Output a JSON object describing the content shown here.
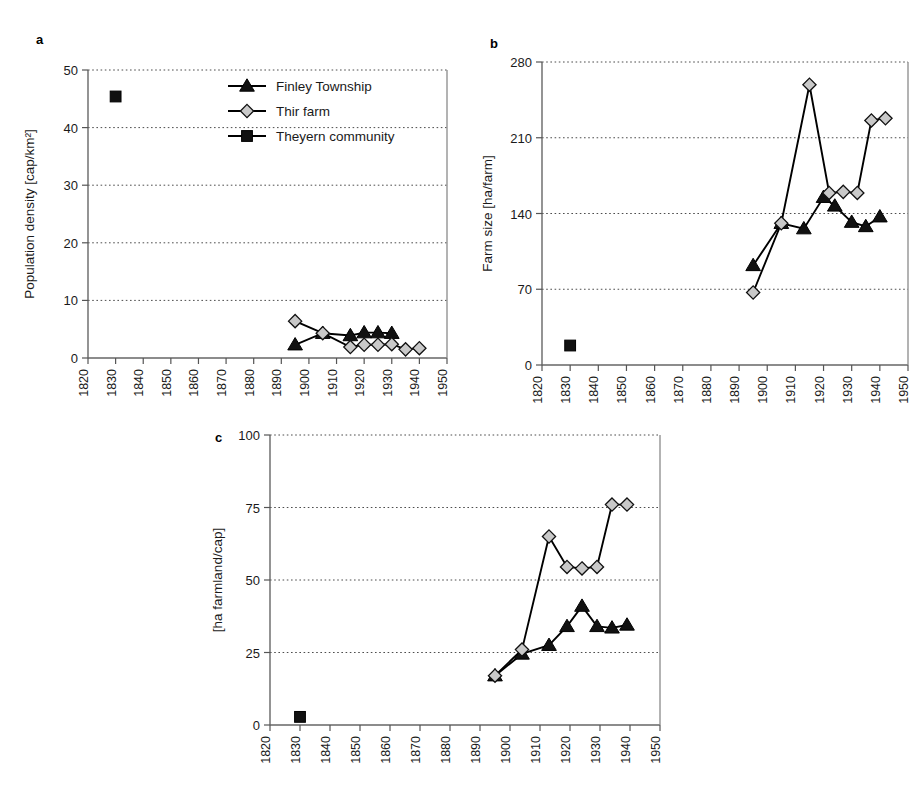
{
  "figure": {
    "background": "#ffffff",
    "panel_letters": [
      "a",
      "b",
      "c"
    ],
    "legend": {
      "position": "panel-a-top-right",
      "entries": [
        {
          "label": "Finley Township",
          "marker": "triangle",
          "color": "#111111"
        },
        {
          "label": "Thir farm",
          "marker": "diamond",
          "color": "#c9c9c9"
        },
        {
          "label": "Theyern community",
          "marker": "square",
          "color": "#111111"
        }
      ]
    }
  },
  "chart_data": [
    {
      "type": "line",
      "panel": "a",
      "title": "",
      "xlabel": "",
      "ylabel": "Population density [cap/km²]",
      "xlim": [
        1820,
        1950
      ],
      "ylim": [
        0,
        50
      ],
      "xticks": [
        1820,
        1830,
        1840,
        1850,
        1860,
        1870,
        1880,
        1890,
        1900,
        1910,
        1920,
        1930,
        1940,
        1950
      ],
      "yticks": [
        0,
        10,
        20,
        30,
        40,
        50
      ],
      "grid": "horizontal-dotted",
      "legend": [
        "Finley Township",
        "Thir farm",
        "Theyern community"
      ],
      "series": [
        {
          "name": "Finley Township",
          "marker": "triangle",
          "x": [
            1895,
            1905,
            1915,
            1920,
            1925,
            1930
          ],
          "y": [
            2.3,
            4.3,
            3.9,
            4.4,
            4.4,
            4.3
          ]
        },
        {
          "name": "Thir farm",
          "marker": "diamond",
          "x": [
            1895,
            1905,
            1915,
            1920,
            1925,
            1930,
            1935,
            1940
          ],
          "y": [
            6.4,
            4.3,
            1.9,
            2.3,
            2.3,
            2.4,
            1.5,
            1.7
          ]
        },
        {
          "name": "Theyern community",
          "marker": "square",
          "x": [
            1830
          ],
          "y": [
            45.4
          ]
        }
      ]
    },
    {
      "type": "line",
      "panel": "b",
      "title": "",
      "xlabel": "",
      "ylabel": "Farm size [ha/farm]",
      "xlim": [
        1820,
        1950
      ],
      "ylim": [
        0,
        280
      ],
      "xticks": [
        1820,
        1830,
        1840,
        1850,
        1860,
        1870,
        1880,
        1890,
        1900,
        1910,
        1920,
        1930,
        1940,
        1950
      ],
      "yticks": [
        0,
        70,
        140,
        210,
        280
      ],
      "grid": "horizontal-dotted",
      "series": [
        {
          "name": "Finley Township",
          "marker": "triangle",
          "x": [
            1895,
            1905,
            1913,
            1920,
            1924,
            1930,
            1935,
            1940
          ],
          "y": [
            92,
            131,
            126,
            155,
            147,
            132,
            128,
            137
          ]
        },
        {
          "name": "Thir farm",
          "marker": "diamond",
          "x": [
            1895,
            1905,
            1915,
            1922,
            1927,
            1932,
            1937,
            1942
          ],
          "y": [
            67,
            131,
            259,
            159,
            160,
            159,
            226,
            228
          ]
        },
        {
          "name": "Theyern community",
          "marker": "square",
          "x": [
            1830
          ],
          "y": [
            18
          ]
        }
      ]
    },
    {
      "type": "line",
      "panel": "c",
      "title": "",
      "xlabel": "",
      "ylabel": "[ha farmland/cap]",
      "xlim": [
        1820,
        1950
      ],
      "ylim": [
        0,
        100
      ],
      "xticks": [
        1820,
        1830,
        1840,
        1850,
        1860,
        1870,
        1880,
        1890,
        1900,
        1910,
        1920,
        1930,
        1940,
        1950
      ],
      "yticks": [
        0,
        25,
        50,
        75,
        100
      ],
      "grid": "horizontal-dotted",
      "series": [
        {
          "name": "Finley Township",
          "marker": "triangle",
          "x": [
            1895,
            1904,
            1913,
            1919,
            1924,
            1929,
            1934,
            1939
          ],
          "y": [
            17,
            24.5,
            27.5,
            34,
            41,
            34,
            33.5,
            34.5
          ]
        },
        {
          "name": "Thir farm",
          "marker": "diamond",
          "x": [
            1895,
            1904,
            1913,
            1919,
            1924,
            1929,
            1934,
            1939
          ],
          "y": [
            17,
            26,
            65,
            54.5,
            54,
            54.5,
            76,
            76
          ]
        },
        {
          "name": "Theyern community",
          "marker": "square",
          "x": [
            1830
          ],
          "y": [
            2.8
          ]
        }
      ]
    }
  ]
}
